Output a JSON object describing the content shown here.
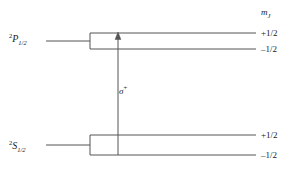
{
  "figure": {
    "type": "energy-level-diagram",
    "title": "",
    "background_color": "#ffffff",
    "line_color": "#555555",
    "text_color": "#1a1a1a"
  },
  "axis_header": {
    "symbol": "m",
    "subscript": "J"
  },
  "states": [
    {
      "id": "upper",
      "term_superscript": "2",
      "term_letter": "P",
      "term_subscript": "1/2",
      "label_plain": "2P1/2",
      "sublevels": [
        {
          "mj_label": "+1/2",
          "position": "upper"
        },
        {
          "mj_label": "–1/2",
          "position": "lower"
        }
      ]
    },
    {
      "id": "lower",
      "term_superscript": "2",
      "term_letter": "S",
      "term_subscript": "1/2",
      "label_plain": "2S1/2",
      "sublevels": [
        {
          "mj_label": "+1/2",
          "position": "upper"
        },
        {
          "mj_label": "–1/2",
          "position": "lower"
        }
      ]
    }
  ],
  "transition": {
    "symbol": "σ",
    "superscript": "+",
    "label_plain": "σ+",
    "direction": "up",
    "from_state": "2S1/2 m_J = -1/2",
    "to_state": "2P1/2 m_J = +1/2"
  },
  "geometry": {
    "upper_level_top_y": 33,
    "upper_level_bottom_y": 49,
    "lower_level_top_y": 135,
    "lower_level_bottom_y": 155,
    "level_line_left_x": 90,
    "level_line_right_x": 256,
    "stub_left_x": 46,
    "arrow_x": 118
  }
}
